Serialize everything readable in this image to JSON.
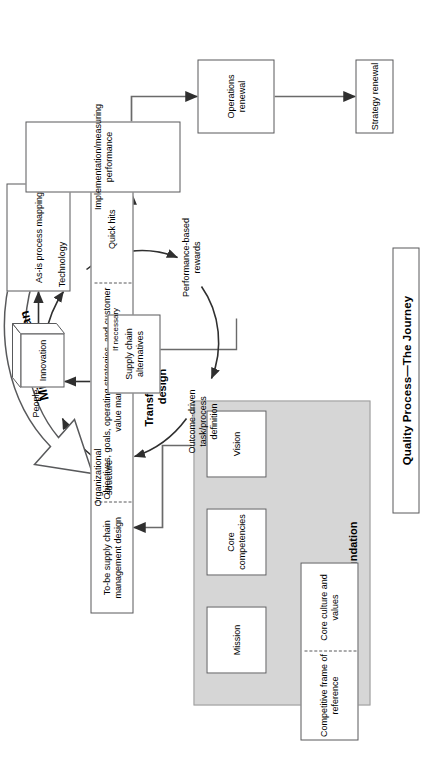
{
  "title": "Quality Process—The Journey",
  "sections": {
    "foundation_label": "Foundation",
    "transformation_label": "Transformation\ndesign"
  },
  "foundation": {
    "inputs": {
      "competitive": "Competitive\nframe of\nreference",
      "culture": "Core culture\nand values"
    },
    "chain": [
      {
        "label": "Mission"
      },
      {
        "label": "Core\ncompetencies"
      },
      {
        "label": "Vision"
      }
    ]
  },
  "design_band": {
    "cells": [
      "To-be\nsupply chain\nmanagement\ndesign",
      "Objectives,\ngoals,\noperating\nstrategies,\nand customer\nvalue\nmanagement",
      "Quick hits"
    ]
  },
  "innovation": {
    "label": "Innovation"
  },
  "as_is": {
    "label": "As-is\nprocess\nmapping"
  },
  "migration": {
    "label": "Migration plan"
  },
  "cycle": {
    "center": "Supply chain\nalternatives",
    "nodes": [
      {
        "label": "People"
      },
      {
        "label": "Technology"
      },
      {
        "label": "Performance-based\nrewards"
      },
      {
        "label": "Outcome-driven\ntask/process\ndefinition"
      },
      {
        "label": "Organizational\nstructure"
      }
    ]
  },
  "implementation": {
    "label": "Implementation/measuring\nperformance"
  },
  "operations_renewal": {
    "label": "Operations\nrenewal"
  },
  "strategy_renewal": {
    "label": "Strategy renewal"
  },
  "if_necessary": {
    "label": "If necessary"
  },
  "colors": {
    "panel_fill": "#d6d6d6",
    "line": "#58595b",
    "text": "#000000",
    "background": "#ffffff"
  }
}
